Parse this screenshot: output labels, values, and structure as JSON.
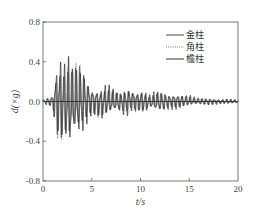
{
  "chart_data": {
    "type": "line",
    "title": "",
    "xlabel": "t/s",
    "ylabel": "d(×g)",
    "xlim": [
      0,
      20
    ],
    "ylim": [
      -0.8,
      0.8
    ],
    "xticks": [
      0,
      5,
      10,
      15,
      20
    ],
    "xtick_labels": [
      "0",
      "5",
      "10",
      "15",
      "20"
    ],
    "yticks": [
      0.8,
      0.4,
      0.0,
      -0.4,
      -0.8
    ],
    "ytick_labels": [
      "0.8",
      "0.4",
      "0.0",
      "-0.4",
      "-0.8"
    ],
    "grid": false,
    "legend_position": "upper right",
    "series": [
      {
        "name": "金柱",
        "line_style": "solid",
        "color": "#333333"
      },
      {
        "name": "角柱",
        "line_style": "dotted",
        "color": "#555555"
      },
      {
        "name": "檐柱",
        "line_style": "solid",
        "color": "#222222"
      }
    ],
    "envelope": {
      "description": "approximate peak amplitude envelope of acceleration time history",
      "t": [
        0,
        0.5,
        1.0,
        1.3,
        1.6,
        2.0,
        2.3,
        2.6,
        3.0,
        3.3,
        3.6,
        4.0,
        4.3,
        4.6,
        5.0,
        5.5,
        6.0,
        6.5,
        7.0,
        7.5,
        8.0,
        8.5,
        9.0,
        9.5,
        10.0,
        10.5,
        11.0,
        11.5,
        12.0,
        12.5,
        13.0,
        13.5,
        14.0,
        14.5,
        15.0,
        15.5,
        16.0,
        17.0,
        18.0,
        19.0,
        20.0
      ],
      "pos": [
        0.02,
        0.05,
        0.08,
        0.38,
        0.48,
        0.52,
        0.4,
        0.54,
        0.42,
        0.44,
        0.48,
        0.38,
        0.33,
        0.24,
        0.16,
        0.14,
        0.13,
        0.2,
        0.17,
        0.12,
        0.1,
        0.14,
        0.18,
        0.12,
        0.13,
        0.1,
        0.07,
        0.12,
        0.12,
        0.1,
        0.08,
        0.1,
        0.09,
        0.07,
        0.07,
        0.05,
        0.04,
        0.04,
        0.03,
        0.03,
        0.02
      ],
      "neg": [
        -0.02,
        -0.05,
        -0.06,
        -0.38,
        -0.44,
        -0.48,
        -0.42,
        -0.62,
        -0.46,
        -0.42,
        -0.4,
        -0.36,
        -0.32,
        -0.22,
        -0.16,
        -0.18,
        -0.22,
        -0.16,
        -0.14,
        -0.12,
        -0.14,
        -0.18,
        -0.1,
        -0.12,
        -0.12,
        -0.14,
        -0.08,
        -0.12,
        -0.12,
        -0.1,
        -0.08,
        -0.09,
        -0.08,
        -0.06,
        -0.05,
        -0.04,
        -0.04,
        -0.04,
        -0.03,
        -0.03,
        -0.02
      ]
    }
  },
  "colors": {
    "axis": "#555555",
    "trace_main": "#2a2a2a",
    "trace_dotted": "#666666",
    "trace_third": "#3a3a3a"
  }
}
